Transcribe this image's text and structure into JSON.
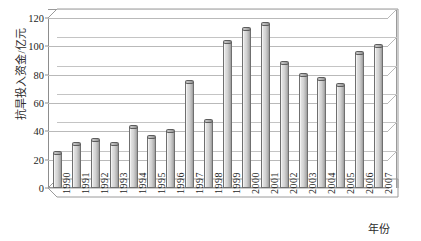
{
  "chart_data": {
    "type": "bar",
    "title": "",
    "subtitle": "",
    "xlabel": "年份",
    "ylabel": "抗旱投入资金/亿元",
    "categories": [
      "1990",
      "1991",
      "1992",
      "1993",
      "1994",
      "1995",
      "1996",
      "1997",
      "1998",
      "1999",
      "2000",
      "2001",
      "2002",
      "2003",
      "2004",
      "2005",
      "2006",
      "2007"
    ],
    "values": [
      25,
      31,
      34,
      31,
      43,
      36,
      40,
      75,
      47,
      103,
      112,
      116,
      88,
      80,
      77,
      73,
      95,
      100
    ],
    "series": [
      {
        "name": "抗旱投入资金",
        "values": [
          25,
          31,
          34,
          31,
          43,
          36,
          40,
          75,
          47,
          103,
          112,
          116,
          88,
          80,
          77,
          73,
          95,
          100
        ]
      }
    ],
    "ylim": [
      0,
      120
    ],
    "yticks": [
      0,
      20,
      40,
      60,
      80,
      100,
      120
    ],
    "ytick_labels": [
      "0",
      "20",
      "40",
      "60",
      "80",
      "100",
      "120"
    ],
    "grid": true,
    "legend": false,
    "legend_position": "none",
    "style": "3d-cylinder-bar",
    "bar_color": "#d2d2d2",
    "bar_edge_color": "#6f6f6f",
    "grid_color": "#b9b9b9",
    "axis_color": "#8d8d8d",
    "background": "#ffffff"
  },
  "axes": {
    "y_title": "抗旱投入资金/亿元",
    "x_title": "年份"
  }
}
